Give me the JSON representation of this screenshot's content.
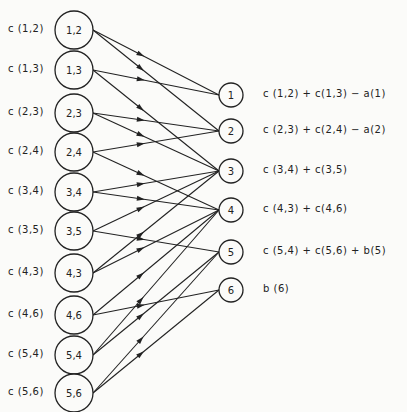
{
  "left_nodes": [
    {
      "id": "1,2",
      "label": "1,2",
      "cost": "c (1,2)",
      "y": 30
    },
    {
      "id": "1,3",
      "label": "1,3",
      "cost": "c (1,3)",
      "y": 70
    },
    {
      "id": "2,3",
      "label": "2,3",
      "cost": "c (2,3)",
      "y": 113
    },
    {
      "id": "2,4",
      "label": "2,4",
      "cost": "c (2,4)",
      "y": 152
    },
    {
      "id": "3,4",
      "label": "3,4",
      "cost": "c (3,4)",
      "y": 192
    },
    {
      "id": "3,5",
      "label": "3,5",
      "cost": "c (3,5)",
      "y": 231
    },
    {
      "id": "4,3",
      "label": "4,3",
      "cost": "c (4,3)",
      "y": 273
    },
    {
      "id": "4,6",
      "label": "4,6",
      "cost": "c (4,6)",
      "y": 315
    },
    {
      "id": "5,4",
      "label": "5,4",
      "cost": "c (5,4)",
      "y": 355
    },
    {
      "id": "5,6",
      "label": "5,6",
      "cost": "c (5,6)",
      "y": 393
    }
  ],
  "right_nodes": [
    {
      "id": "1",
      "label": "1",
      "y": 95,
      "capacity": "c (1,2) + c(1,3) − a(1)"
    },
    {
      "id": "2",
      "label": "2",
      "y": 131,
      "capacity": "c (2,3) + c(2,4) − a(2)"
    },
    {
      "id": "3",
      "label": "3",
      "y": 171,
      "capacity": "c (3,4) + c(3,5)"
    },
    {
      "id": "4",
      "label": "4",
      "y": 210,
      "capacity": "c (4,3) + c(4,6)"
    },
    {
      "id": "5",
      "label": "5",
      "y": 252,
      "capacity": "c (5,4) + c(5,6) + b(5)"
    },
    {
      "id": "6",
      "label": "6",
      "y": 290,
      "capacity": "b (6)"
    }
  ],
  "edges": [
    [
      "1,2",
      "1"
    ],
    [
      "1,2",
      "2"
    ],
    [
      "1,3",
      "1"
    ],
    [
      "1,3",
      "3"
    ],
    [
      "2,3",
      "2"
    ],
    [
      "2,3",
      "3"
    ],
    [
      "2,4",
      "2"
    ],
    [
      "2,4",
      "4"
    ],
    [
      "3,4",
      "3"
    ],
    [
      "3,4",
      "4"
    ],
    [
      "3,5",
      "3"
    ],
    [
      "3,5",
      "5"
    ],
    [
      "4,3",
      "4"
    ],
    [
      "4,3",
      "3"
    ],
    [
      "4,6",
      "4"
    ],
    [
      "4,6",
      "6"
    ],
    [
      "5,4",
      "5"
    ],
    [
      "5,4",
      "4"
    ],
    [
      "5,6",
      "5"
    ],
    [
      "5,6",
      "6"
    ]
  ]
}
